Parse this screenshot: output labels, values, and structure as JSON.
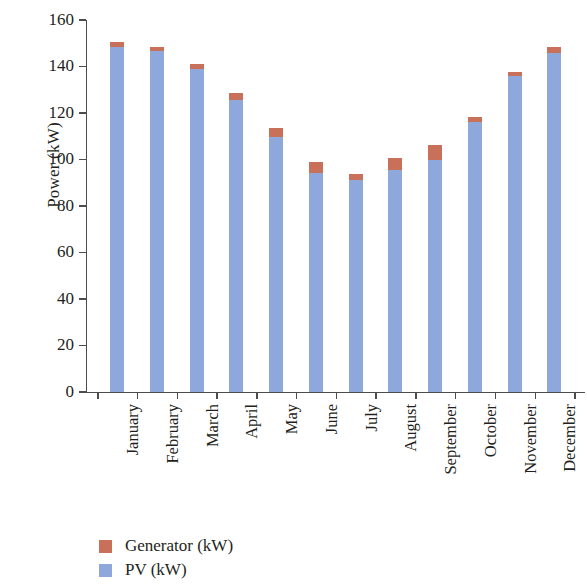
{
  "chart_data": {
    "type": "bar",
    "stacked": true,
    "title": "",
    "xlabel": "",
    "ylabel": "Power (kW)",
    "ylim": [
      0,
      160
    ],
    "yticks": [
      0,
      20,
      40,
      60,
      80,
      100,
      120,
      140,
      160
    ],
    "ytick_labels": [
      "0",
      "20",
      "40",
      "60",
      "80",
      "100",
      "120",
      "140",
      "160"
    ],
    "grid": false,
    "legend_position": "bottom-left",
    "categories": [
      "January",
      "February",
      "March",
      "April",
      "May",
      "June",
      "July",
      "August",
      "September",
      "October",
      "November",
      "December"
    ],
    "series": [
      {
        "name": "Generator (kW)",
        "color": "#c8705a",
        "values": [
          2.2,
          1.8,
          2.2,
          3.0,
          3.9,
          4.7,
          2.6,
          5.2,
          6.5,
          2.2,
          1.7,
          2.6
        ]
      },
      {
        "name": "PV (kW)",
        "color": "#8fa8dc",
        "values": [
          148.4,
          146.6,
          138.8,
          125.6,
          109.7,
          94.2,
          91.2,
          95.3,
          99.8,
          116.3,
          135.9,
          145.9
        ]
      }
    ],
    "totals": [
      150.6,
      148.4,
      141.0,
      128.6,
      113.6,
      98.9,
      93.8,
      100.5,
      106.3,
      118.5,
      137.6,
      148.5
    ]
  },
  "legend": {
    "items": [
      {
        "label": "Generator (kW)",
        "color": "#c8705a"
      },
      {
        "label": "PV (kW)",
        "color": "#8fa8dc"
      }
    ]
  }
}
